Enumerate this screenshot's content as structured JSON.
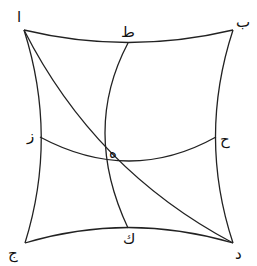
{
  "diagram": {
    "type": "spherical-quadrilateral",
    "colors": {
      "stroke": "#222222",
      "text": "#111111",
      "background": "#ffffff"
    },
    "labels": {
      "alif": "ا",
      "ba": "ب",
      "ta": "ط",
      "jim": "ج",
      "dal": "د",
      "kaf": "ك",
      "zay": "ز",
      "ha": "ح",
      "he": "ه"
    },
    "points": {
      "alif": [
        24,
        30
      ],
      "ba": [
        233,
        30
      ],
      "jim": [
        25,
        243
      ],
      "dal": [
        233,
        243
      ],
      "ta": [
        128,
        43
      ],
      "kaf": [
        128,
        228
      ],
      "zay": [
        40,
        137
      ],
      "ha": [
        216,
        137
      ],
      "he": [
        104,
        162
      ]
    }
  }
}
